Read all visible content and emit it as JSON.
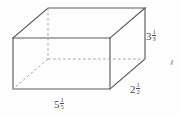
{
  "figure": {
    "kind": "rectangular-prism",
    "projection": "oblique",
    "background_color": "#fefefe",
    "line_color": "#5a5a5a",
    "hidden_line_color": "#9a9a9a",
    "label_color": "#4a4a4a"
  },
  "labels": {
    "height": {
      "whole": "3",
      "numerator": "1",
      "denominator": "3",
      "full": "3 1/3",
      "edge": "vertical-right-front"
    },
    "depth": {
      "whole": "2",
      "numerator": "1",
      "denominator": "2",
      "full": "2 1/2",
      "edge": "oblique-right-bottom"
    },
    "width": {
      "whole": "5",
      "numerator": "1",
      "denominator": "5",
      "full": "5 1/5",
      "edge": "horizontal-bottom-front"
    }
  },
  "geometry": {
    "front_face": {
      "top_left": [
        13,
        38
      ],
      "top_right": [
        110,
        38
      ],
      "bottom_right": [
        110,
        89
      ],
      "bottom_left": [
        13,
        89
      ]
    },
    "back_offset": [
      35,
      -30
    ],
    "back_face": {
      "top_left": [
        48,
        8
      ],
      "top_right": [
        145,
        8
      ],
      "bottom_right": [
        145,
        59
      ],
      "bottom_left": [
        48,
        59
      ]
    },
    "hidden_vertex": [
      48,
      59
    ],
    "hidden_edges": [
      "back-bottom-left to front-bottom-left",
      "back-bottom-left to back-bottom-right",
      "back-bottom-left to back-top-left"
    ]
  }
}
